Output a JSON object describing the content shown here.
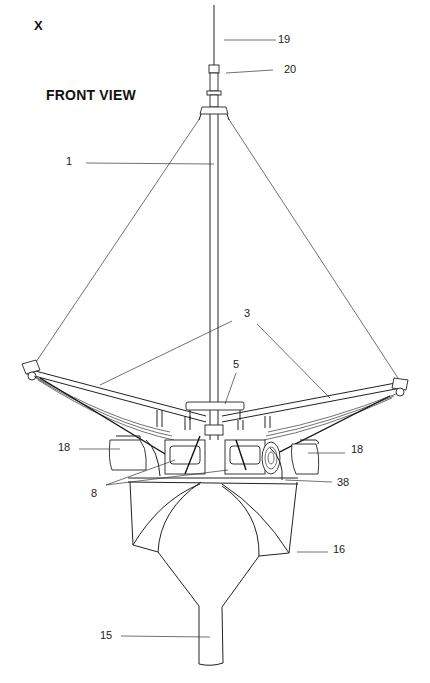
{
  "figure": {
    "id_label": "X",
    "view_title": "FRONT VIEW",
    "callouts": [
      {
        "id": "19",
        "label": "19",
        "x": 278,
        "y": 35
      },
      {
        "id": "20",
        "label": "20",
        "x": 284,
        "y": 67
      },
      {
        "id": "1",
        "label": "1",
        "x": 66,
        "y": 157
      },
      {
        "id": "3",
        "label": "3",
        "x": 244,
        "y": 309
      },
      {
        "id": "5",
        "label": "5",
        "x": 233,
        "y": 360
      },
      {
        "id": "18l",
        "label": "18",
        "x": 58,
        "y": 443
      },
      {
        "id": "18r",
        "label": "18",
        "x": 351,
        "y": 445
      },
      {
        "id": "38",
        "label": "38",
        "x": 337,
        "y": 478
      },
      {
        "id": "8",
        "label": "8",
        "x": 91,
        "y": 488
      },
      {
        "id": "16",
        "label": "16",
        "x": 333,
        "y": 545
      },
      {
        "id": "15",
        "label": "15",
        "x": 100,
        "y": 631
      }
    ],
    "colors": {
      "ink": "#111111",
      "background": "#ffffff"
    }
  }
}
